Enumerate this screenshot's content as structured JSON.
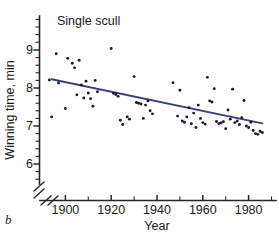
{
  "figure": {
    "panel_label": "b",
    "title": "Single scull",
    "background": "#ffffff",
    "point_color": "#1c1c2e",
    "fit_line_color": "#36427d",
    "axis_color": "#262626"
  },
  "chart_data": {
    "type": "scatter",
    "title": "Single scull",
    "xlabel": "Year",
    "ylabel": "Winning time, min",
    "xlim": [
      1890,
      1992
    ],
    "ylim": [
      5.6,
      9.5
    ],
    "grid": false,
    "legend": null,
    "axis_break": {
      "x_axis": true,
      "y_axis": true,
      "note": "double slash break near origin on both axes"
    },
    "xticks": [
      1900,
      1920,
      1940,
      1960,
      1980
    ],
    "xtick_labels": [
      "1900",
      "1920",
      "1940",
      "1960",
      "1980"
    ],
    "x_minor_tick_interval": 10,
    "yticks": [
      6,
      7,
      8,
      9
    ],
    "ytick_labels": [
      "6",
      "7",
      "8",
      "9"
    ],
    "y_minor_tick_interval": 0.2,
    "series": [
      {
        "name": "Winning time",
        "marker": "circle",
        "x": [
          1893,
          1894,
          1896,
          1897,
          1900,
          1901,
          1903,
          1904,
          1905,
          1906,
          1907,
          1908,
          1909,
          1910,
          1911,
          1912,
          1913,
          1914,
          1920,
          1921,
          1922,
          1923,
          1924,
          1925,
          1927,
          1928,
          1930,
          1931,
          1932,
          1933,
          1934,
          1935,
          1936,
          1937,
          1938,
          1947,
          1949,
          1950,
          1951,
          1952,
          1953,
          1954,
          1955,
          1956,
          1957,
          1958,
          1959,
          1960,
          1961,
          1962,
          1963,
          1964,
          1965,
          1966,
          1967,
          1968,
          1969,
          1970,
          1971,
          1972,
          1973,
          1974,
          1975,
          1976,
          1977,
          1978,
          1979,
          1980,
          1981,
          1982,
          1983,
          1984,
          1985,
          1986
        ],
        "y": [
          8.21,
          7.24,
          8.9,
          8.13,
          7.46,
          8.78,
          8.65,
          8.53,
          7.82,
          8.73,
          8.08,
          7.74,
          8.18,
          7.87,
          7.72,
          7.52,
          8.2,
          7.9,
          9.04,
          7.86,
          7.83,
          7.78,
          7.15,
          7.04,
          7.24,
          7.18,
          8.3,
          7.62,
          7.6,
          7.58,
          7.2,
          7.55,
          7.66,
          7.4,
          7.32,
          8.14,
          7.26,
          7.94,
          7.13,
          7.1,
          7.24,
          7.48,
          7.06,
          7.34,
          6.96,
          7.55,
          7.2,
          7.09,
          7.05,
          8.28,
          7.66,
          7.63,
          7.98,
          7.12,
          7.06,
          7.08,
          7.11,
          6.93,
          7.42,
          7.18,
          7.97,
          7.09,
          7.13,
          7.04,
          7.22,
          7.67,
          7.0,
          6.96,
          7.1,
          6.88,
          6.8,
          6.78,
          6.86,
          6.83
        ]
      }
    ],
    "fit": {
      "type": "linear",
      "label": "least-squares fit",
      "x_start": 1894,
      "y_start": 8.23,
      "x_end": 1986,
      "y_end": 7.07,
      "color": "#36427d"
    }
  }
}
